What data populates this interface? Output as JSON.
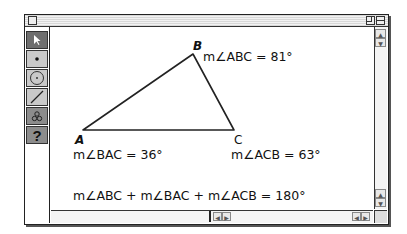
{
  "window": {
    "title": ""
  },
  "toolbox": {
    "tools": [
      {
        "name": "arrow-tool",
        "icon": "arrow-icon",
        "selected": true
      },
      {
        "name": "point-tool",
        "icon": "point-icon",
        "selected": false
      },
      {
        "name": "compass-tool",
        "icon": "compass-icon",
        "selected": false
      },
      {
        "name": "straightedge-tool",
        "icon": "line-icon",
        "selected": false
      },
      {
        "name": "custom-tool",
        "icon": "custom-icon",
        "selected": false
      },
      {
        "name": "information-tool",
        "icon": "question-icon",
        "label": "?",
        "selected": false
      }
    ]
  },
  "canvas": {
    "vertices": {
      "A": {
        "label": "A",
        "x": 83,
        "y": 129
      },
      "B": {
        "label": "B",
        "x": 193,
        "y": 53
      },
      "C": {
        "label": "C",
        "x": 234,
        "y": 129
      }
    },
    "measurements": {
      "abc": "m∠ABC = 81°",
      "bac": "m∠BAC = 36°",
      "acb": "m∠ACB = 63°",
      "sum": "m∠ABC + m∠BAC + m∠ACB = 180°"
    }
  },
  "scrollbars": {
    "up_arrow": "▲",
    "down_arrow": "▼",
    "left_arrow": "◀",
    "right_arrow": "▶"
  }
}
